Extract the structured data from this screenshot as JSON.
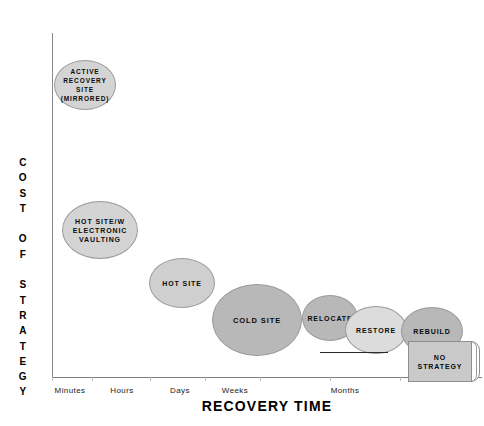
{
  "chart": {
    "x_axis_title": "RECOVERY TIME",
    "y_axis_title": "C\nO\nS\nT\n\nO\nF\n\nS\nT\nR\nA\nT\nE\nG\nY",
    "y_axis_title_plain": "COST OF STRATEGY"
  },
  "chart_data": {
    "type": "scatter",
    "title": "",
    "subtitle": "",
    "xlabel": "RECOVERY TIME",
    "ylabel": "COST OF STRATEGY",
    "grid": false,
    "legend": "none",
    "xticklabels": [
      "Minutes",
      "Hours",
      "Days",
      "Weeks",
      "Months"
    ],
    "yticklabels": [],
    "note": "Qualitative bubble chart: recovery strategy cost decreases as recovery time increases; bubble size grows toward mid/long recovery times.",
    "points": [
      {
        "label": "ACTIVE\nRECOVERY\nSITE\n(MIRRORED)",
        "label_plain": "ACTIVE RECOVERY SITE (MIRRORED)",
        "x_category": "Minutes",
        "cost_rank": 1,
        "time_rank": 1,
        "cx": 85,
        "cy": 85,
        "rx": 31,
        "ry": 25,
        "fill": "#d4d4d4"
      },
      {
        "label": "HOT SITE/W\nELECTRONIC\nVAULTING",
        "label_plain": "HOT SITE/W ELECTRONIC VAULTING",
        "x_category": "Hours",
        "cost_rank": 2,
        "time_rank": 2,
        "cx": 100,
        "cy": 230,
        "rx": 38,
        "ry": 29,
        "fill": "#d4d4d4"
      },
      {
        "label": "HOT SITE",
        "label_plain": "HOT SITE",
        "x_category": "Days",
        "cost_rank": 3,
        "time_rank": 3,
        "cx": 182,
        "cy": 283,
        "rx": 33,
        "ry": 25,
        "fill": "#cfcfcf"
      },
      {
        "label": "COLD SITE",
        "label_plain": "COLD SITE",
        "x_category": "Weeks",
        "cost_rank": 4,
        "time_rank": 4,
        "cx": 257,
        "cy": 320,
        "rx": 45,
        "ry": 36,
        "fill": "#b8b8b8"
      },
      {
        "label": "RELOCATE",
        "label_plain": "RELOCATE",
        "x_category": "Weeks",
        "cost_rank": 5,
        "time_rank": 5,
        "cx": 330,
        "cy": 318,
        "rx": 28,
        "ry": 23,
        "fill": "#b8b8b8"
      },
      {
        "label": "RESTORE",
        "label_plain": "RESTORE",
        "x_category": "Months",
        "cost_rank": 6,
        "time_rank": 6,
        "cx": 376,
        "cy": 330,
        "rx": 31,
        "ry": 24,
        "fill": "#dcdcdc"
      },
      {
        "label": "REBUILD",
        "label_plain": "REBUILD",
        "x_category": "Months",
        "cost_rank": 7,
        "time_rank": 7,
        "cx": 432,
        "cy": 331,
        "rx": 31,
        "ry": 24,
        "fill": "#b8b8b8"
      },
      {
        "label": "NO\nSTRATEGY",
        "label_plain": "NO STRATEGY",
        "shape": "box3d",
        "x_category": "Months",
        "cost_rank": 8,
        "time_rank": 8,
        "cx": 440,
        "cy": 362,
        "rx": 32,
        "ry": 20,
        "fill": "#c9c9c9"
      }
    ],
    "annotations": [
      {
        "type": "rule",
        "x1": 320,
        "x2": 388,
        "y": 352
      }
    ]
  },
  "bubbles": [
    {
      "label": "ACTIVE\nRECOVERY\nSITE\n(MIRRORED)",
      "left": 54,
      "top": 60,
      "width": 62,
      "height": 50,
      "fill": "#d4d4d4",
      "fontsize": "6.5px"
    },
    {
      "label": "HOT SITE/W\nELECTRONIC\nVAULTING",
      "left": 62,
      "top": 201,
      "width": 76,
      "height": 58,
      "fill": "#d4d4d4",
      "fontsize": "7px"
    },
    {
      "label": "HOT SITE",
      "left": 149,
      "top": 258,
      "width": 66,
      "height": 50,
      "fill": "#cfcfcf",
      "fontsize": "7px"
    },
    {
      "label": "COLD SITE",
      "left": 212,
      "top": 284,
      "width": 90,
      "height": 72,
      "fill": "#b8b8b8",
      "fontsize": "7.5px"
    },
    {
      "label": "RELOCATE",
      "left": 302,
      "top": 295,
      "width": 56,
      "height": 46,
      "fill": "#b8b8b8",
      "fontsize": "7px"
    },
    {
      "label": "RESTORE",
      "left": 345,
      "top": 306,
      "width": 62,
      "height": 48,
      "fill": "#dcdcdc",
      "fontsize": "7px"
    },
    {
      "label": "REBUILD",
      "left": 401,
      "top": 307,
      "width": 62,
      "height": 48,
      "fill": "#b8b8b8",
      "fontsize": "7px"
    }
  ],
  "no_strategy": {
    "label": "NO\nSTRATEGY"
  },
  "x_ticks": [
    {
      "label": "Minutes",
      "x": 70
    },
    {
      "label": "Hours",
      "x": 122
    },
    {
      "label": "Days",
      "x": 180
    },
    {
      "label": "Weeks",
      "x": 235
    },
    {
      "label": "Months",
      "x": 345
    }
  ],
  "tick_marks": [
    52,
    92,
    150,
    205,
    260,
    330,
    400,
    470
  ]
}
